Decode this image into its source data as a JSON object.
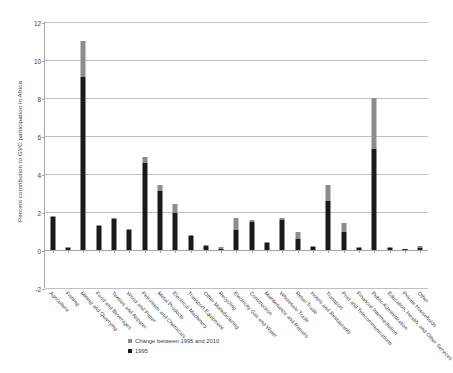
{
  "chart_data": {
    "type": "bar",
    "title": "",
    "xlabel": "",
    "ylabel": "Percent contribution to GVC participation in Africa",
    "ylim": [
      -2,
      12
    ],
    "yticks": [
      -2,
      0,
      2,
      4,
      6,
      8,
      10,
      12
    ],
    "grid": true,
    "stacked": true,
    "legend_position": "bottom-center",
    "colors": {
      "1995": "#1a1a1a",
      "change": "#8c8c8c"
    },
    "categories": [
      "Agriculture",
      "Fishing",
      "Mining and Quarrying",
      "Food and Beverages",
      "Textiles and Apparel",
      "Wood and Paper",
      "Petroleum and Chemicals",
      "Metal Products",
      "Electrical Machinery",
      "Transport Equipment",
      "Other Manufacturing",
      "Recycling",
      "Electricity Gas and Water",
      "Construction",
      "Maintenance and Repairs",
      "Wholesale Trade",
      "Retail Trade",
      "Hotels and Restaurants",
      "Transport",
      "Post and Telecommunications",
      "Financial Intermediation",
      "Public Administration",
      "Education, Health, and Other Services",
      "Private Households",
      "Other"
    ],
    "series": [
      {
        "name": "1995",
        "color": "#1a1a1a",
        "values": [
          1.75,
          0.12,
          9.1,
          1.25,
          1.65,
          1.05,
          4.6,
          3.1,
          1.95,
          0.75,
          0.2,
          0.05,
          1.05,
          1.5,
          0.35,
          1.6,
          0.6,
          0.15,
          2.6,
          0.95,
          0.12,
          5.3,
          0.1,
          0.05,
          0.12
        ],
        "legend_label": "1995"
      },
      {
        "name": "Change between 1995 and 2010",
        "color": "#8c8c8c",
        "values": [
          0.05,
          0.03,
          1.9,
          0.05,
          0.05,
          0.05,
          0.3,
          0.3,
          0.45,
          0.05,
          0.05,
          0.12,
          0.65,
          0.08,
          0.05,
          0.1,
          0.35,
          0.05,
          0.8,
          0.45,
          0.06,
          2.7,
          0.05,
          0.02,
          0.1
        ],
        "legend_label": "Change between 1995 and 2010"
      }
    ],
    "totals": [
      1.8,
      0.15,
      11.0,
      1.3,
      1.7,
      1.1,
      4.9,
      3.4,
      2.4,
      0.8,
      0.25,
      0.17,
      1.7,
      1.58,
      0.4,
      1.7,
      0.95,
      0.2,
      3.4,
      1.4,
      0.18,
      8.0,
      0.15,
      0.07,
      0.22
    ]
  },
  "legend": {
    "items": [
      {
        "label": "Change between 1995 and 2010",
        "color": "#8c8c8c"
      },
      {
        "label": "1995",
        "color": "#1a1a1a"
      }
    ]
  }
}
